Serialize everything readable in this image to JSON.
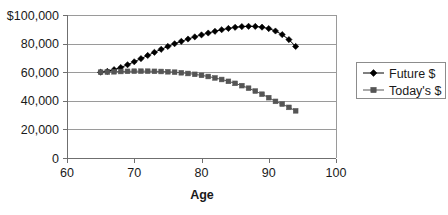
{
  "chart_data": {
    "type": "line",
    "title": "",
    "subtitle": "",
    "xlabel": "Age",
    "ylabel": "",
    "xlim": [
      60,
      100
    ],
    "ylim": [
      0,
      100000
    ],
    "grid": true,
    "legend_position": "right",
    "x_ticks": [
      "60",
      "70",
      "80",
      "90",
      "100"
    ],
    "x_tick_values": [
      60,
      70,
      80,
      90,
      100
    ],
    "y_ticks": [
      "0",
      "20,000",
      "40,000",
      "60,000",
      "80,000",
      "$100,000"
    ],
    "y_tick_values": [
      0,
      20000,
      40000,
      60000,
      80000,
      100000
    ],
    "x": [
      65,
      66,
      67,
      68,
      69,
      70,
      71,
      72,
      73,
      74,
      75,
      76,
      77,
      78,
      79,
      80,
      81,
      82,
      83,
      84,
      85,
      86,
      87,
      88,
      89,
      90,
      91,
      92,
      93,
      94
    ],
    "series": [
      {
        "name": "Future $",
        "marker": "diamond",
        "color": "#000000",
        "values": [
          60000,
          60600,
          61800,
          63300,
          65200,
          67300,
          69500,
          71700,
          73900,
          76000,
          78000,
          79900,
          81600,
          83200,
          84700,
          86100,
          87400,
          88600,
          89700,
          90600,
          91400,
          91900,
          92100,
          92000,
          91500,
          90500,
          88800,
          86300,
          82800,
          78000
        ]
      },
      {
        "name": "Today's $",
        "marker": "square",
        "color": "#555555",
        "values": [
          60000,
          60100,
          60300,
          60500,
          60600,
          60700,
          60700,
          60700,
          60600,
          60500,
          60300,
          60000,
          59600,
          59100,
          58500,
          57800,
          57000,
          56000,
          54900,
          53600,
          52200,
          50600,
          48800,
          46800,
          44600,
          42200,
          39600,
          37700,
          35400,
          33000
        ]
      }
    ]
  },
  "legend": {
    "entries": [
      {
        "label": "Future $"
      },
      {
        "label": "Today's $"
      }
    ]
  }
}
